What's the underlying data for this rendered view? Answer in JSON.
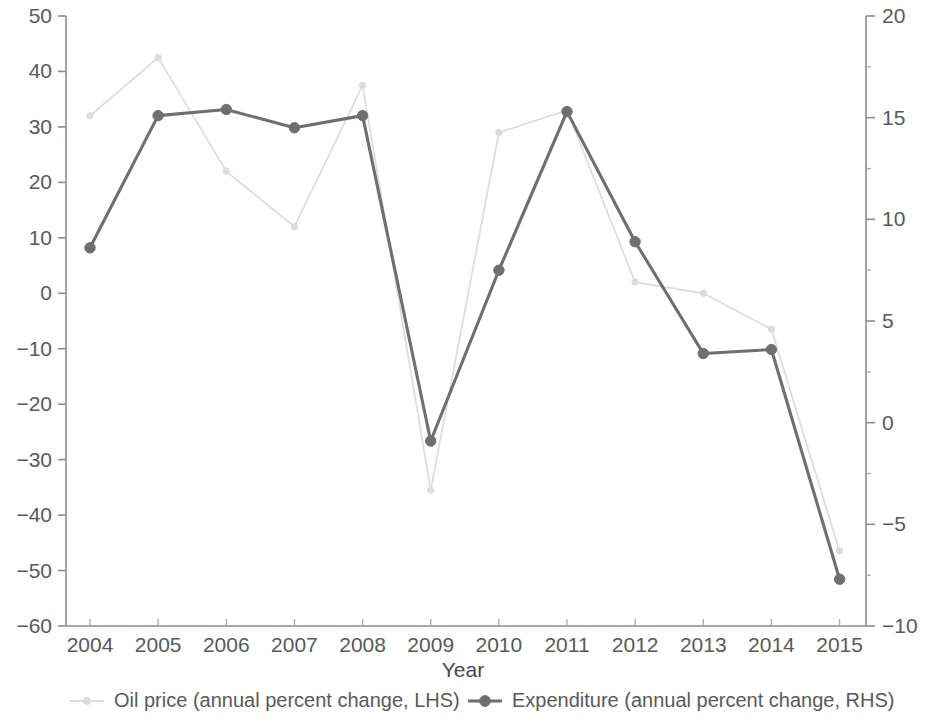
{
  "chart_data": {
    "type": "line",
    "title": "",
    "xlabel": "Year",
    "ylabel": "",
    "grid": false,
    "legend_position": "bottom",
    "categories": [
      2004,
      2005,
      2006,
      2007,
      2008,
      2009,
      2010,
      2011,
      2012,
      2013,
      2014,
      2015
    ],
    "x_tick_labels": [
      "2004",
      "2005",
      "2006",
      "2007",
      "2008",
      "2009",
      "2010",
      "2011",
      "2012",
      "2013",
      "2014",
      "2015"
    ],
    "left_axis": {
      "name": "LHS",
      "ylim": [
        -60,
        50
      ],
      "tick_step": 10,
      "tick_values": [
        50,
        40,
        30,
        20,
        10,
        0,
        -10,
        -20,
        -30,
        -40,
        -50,
        -60
      ],
      "tick_labels": [
        "50",
        "40",
        "30",
        "20",
        "10",
        "0",
        "−10",
        "−20",
        "−30",
        "−40",
        "−50",
        "−60"
      ]
    },
    "right_axis": {
      "name": "RHS",
      "ylim": [
        -10,
        20
      ],
      "tick_step": 5,
      "tick_values": [
        20,
        15,
        10,
        5,
        0,
        -5,
        -10
      ],
      "tick_labels": [
        "20",
        "15",
        "10",
        "5",
        "0",
        "−5",
        "−10"
      ],
      "minor_tick_values": [
        17.5,
        12.5,
        7.5,
        2.5,
        -2.5,
        -7.5
      ]
    },
    "series": [
      {
        "name": "Oil price (annual percent change, LHS)",
        "axis": "left",
        "color": "#dcdcdc",
        "marker": "circle",
        "values": [
          32,
          42.5,
          22,
          12,
          37.5,
          -35.5,
          29,
          33,
          2,
          0,
          -6.5,
          -46.5
        ]
      },
      {
        "name": "Expenditure (annual percent change, RHS)",
        "axis": "right",
        "color": "#6f6f6f",
        "marker": "circle",
        "values": [
          8.6,
          15.1,
          15.4,
          14.5,
          15.1,
          -0.9,
          7.5,
          15.3,
          8.9,
          3.4,
          3.6,
          -7.7
        ]
      }
    ]
  },
  "legend": {
    "items": [
      {
        "label": "Oil price (annual percent change, LHS)",
        "color": "#dcdcdc"
      },
      {
        "label": "Expenditure (annual percent change, RHS)",
        "color": "#6f6f6f"
      }
    ]
  },
  "axis_titles": {
    "x": "Year"
  }
}
